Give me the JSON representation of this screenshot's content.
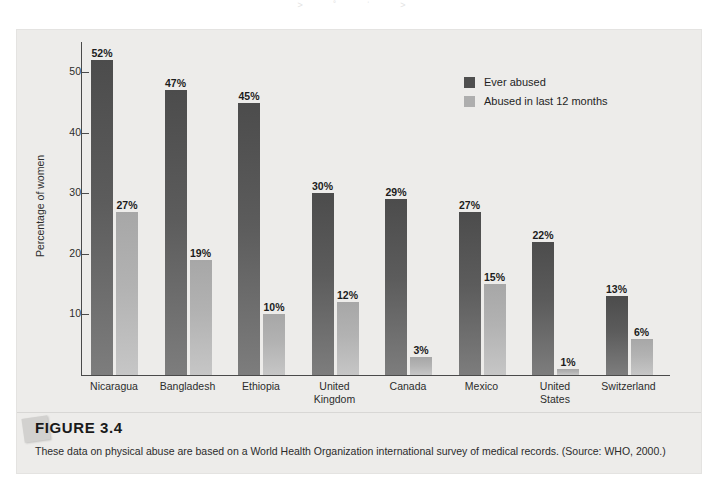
{
  "page_remnant": "˃ ˚ ˈ ˃",
  "figure": {
    "number_label": "FIGURE 3.4",
    "caption": "These data on physical abuse are based on a World Health Organization international survey of medical records. (Source: WHO, 2000.)"
  },
  "legend": {
    "items": [
      {
        "label": "Ever abused",
        "color": "#4f4f4f",
        "icon": "square-swatch-icon"
      },
      {
        "label": "Abused in last 12 months",
        "color": "#aeaeae",
        "icon": "square-swatch-icon"
      }
    ]
  },
  "chart_data": {
    "type": "bar",
    "title": "",
    "xlabel": "",
    "ylabel": "Percentage of women",
    "ylim": [
      0,
      55
    ],
    "yticks": [
      10,
      20,
      30,
      40,
      50
    ],
    "ytick_labels": [
      "10",
      "20",
      "30",
      "40",
      "50"
    ],
    "grid": false,
    "legend_position": "upper-right-inside",
    "categories": [
      "Nicaragua",
      "Bangladesh",
      "Ethiopia",
      "United Kingdom",
      "Canada",
      "Mexico",
      "United States",
      "Switzerland"
    ],
    "category_lines": [
      [
        "Nicaragua"
      ],
      [
        "Bangladesh"
      ],
      [
        "Ethiopia"
      ],
      [
        "United",
        "Kingdom"
      ],
      [
        "Canada"
      ],
      [
        "Mexico"
      ],
      [
        "United",
        "States"
      ],
      [
        "Switzerland"
      ]
    ],
    "series": [
      {
        "name": "Ever abused",
        "color": "#4f4f4f",
        "values": [
          52,
          47,
          45,
          30,
          29,
          27,
          22,
          13
        ],
        "data_labels": [
          "52%",
          "47%",
          "45%",
          "30%",
          "29%",
          "27%",
          "22%",
          "13%"
        ]
      },
      {
        "name": "Abused in last 12 months",
        "color": "#aeaeae",
        "values": [
          27,
          19,
          10,
          12,
          3,
          15,
          1,
          6
        ],
        "data_labels": [
          "27%",
          "19%",
          "10%",
          "12%",
          "3%",
          "15%",
          "1%",
          "6%"
        ]
      }
    ]
  }
}
